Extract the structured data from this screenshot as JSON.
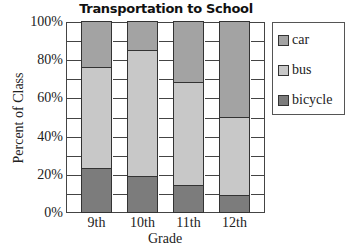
{
  "chart_data": {
    "type": "bar",
    "stacked": true,
    "title": "Transportation to School",
    "xlabel": "Grade",
    "ylabel": "Percent of Class",
    "categories": [
      "9th",
      "10th",
      "11th",
      "12th"
    ],
    "series": [
      {
        "name": "bicycle",
        "values": [
          23,
          19,
          14,
          9
        ],
        "color": "#7c7c7c"
      },
      {
        "name": "bus",
        "values": [
          53,
          66,
          54,
          41
        ],
        "color": "#c8c8c8"
      },
      {
        "name": "car",
        "values": [
          24,
          15,
          32,
          50
        ],
        "color": "#a3a3a3"
      }
    ],
    "yticks": [
      "0%",
      "20%",
      "40%",
      "60%",
      "80%",
      "100%"
    ],
    "ylim": [
      0,
      100
    ],
    "grid": true,
    "legend": {
      "position": "right",
      "entries": [
        "car",
        "bus",
        "bicycle"
      ]
    }
  },
  "legend": {
    "items": [
      {
        "label": "car",
        "color": "#a3a3a3"
      },
      {
        "label": "bus",
        "color": "#c8c8c8"
      },
      {
        "label": "bicycle",
        "color": "#7c7c7c"
      }
    ]
  }
}
